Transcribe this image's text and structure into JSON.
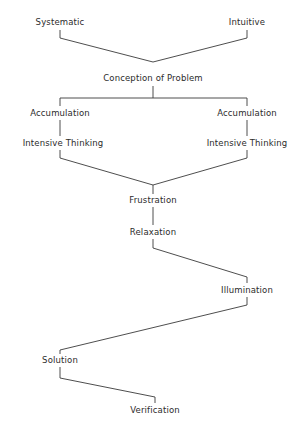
{
  "diagram": {
    "type": "flowchart",
    "width": 303,
    "height": 430,
    "background_color": "#ffffff",
    "line_color": "#3a3a3a",
    "text_color": "#2b2b2b",
    "nodes": [
      {
        "id": "systematic",
        "label": "Systematic",
        "x": 60,
        "y": 22
      },
      {
        "id": "intuitive",
        "label": "Intuitive",
        "x": 247,
        "y": 22
      },
      {
        "id": "conception",
        "label": "Conception of Problem",
        "x": 153,
        "y": 78
      },
      {
        "id": "accumulation-left",
        "label": "Accumulation",
        "x": 60,
        "y": 113
      },
      {
        "id": "accumulation-right",
        "label": "Accumulation",
        "x": 247,
        "y": 113
      },
      {
        "id": "intensive-thinking-left",
        "label": "Intensive Thinking",
        "x": 63,
        "y": 143
      },
      {
        "id": "intensive-thinking-right",
        "label": "Intensive Thinking",
        "x": 247,
        "y": 143
      },
      {
        "id": "frustration",
        "label": "Frustration",
        "x": 153,
        "y": 200
      },
      {
        "id": "relaxation",
        "label": "Relaxation",
        "x": 153,
        "y": 232
      },
      {
        "id": "illumination",
        "label": "Illumination",
        "x": 247,
        "y": 290
      },
      {
        "id": "solution",
        "label": "Solution",
        "x": 60,
        "y": 360
      },
      {
        "id": "verification",
        "label": "Verification",
        "x": 155,
        "y": 410
      }
    ],
    "connectors": [
      {
        "id": "systematic-to-conception",
        "points": "60,30 60,38 153,62"
      },
      {
        "id": "intuitive-to-conception",
        "points": "247,30 247,38 153,62"
      },
      {
        "id": "conception-down",
        "points": "153,86 153,98"
      },
      {
        "id": "split-bus",
        "points": "60,98 247,98"
      },
      {
        "id": "bus-to-accumulation-left",
        "points": "60,98 60,106"
      },
      {
        "id": "bus-to-accumulation-right",
        "points": "247,98 247,106"
      },
      {
        "id": "accumulation-left-to-thinking-left",
        "points": "60,120 60,136"
      },
      {
        "id": "accumulation-right-to-thinking-right",
        "points": "247,120 247,136"
      },
      {
        "id": "thinking-left-to-frustration",
        "points": "60,150 60,158 153,185"
      },
      {
        "id": "thinking-right-to-frustration",
        "points": "247,150 247,158 153,185"
      },
      {
        "id": "frustration-to-relaxation",
        "points": "153,185 153,194"
      },
      {
        "id": "frustration-relaxation-gap",
        "points": "153,207 153,225"
      },
      {
        "id": "relaxation-to-illumination",
        "points": "153,239 153,248 247,277 247,283"
      },
      {
        "id": "illumination-to-solution",
        "points": "247,297 247,305 60,350 60,354"
      },
      {
        "id": "solution-to-verification",
        "points": "60,367 60,378 155,397 155,403"
      }
    ]
  }
}
